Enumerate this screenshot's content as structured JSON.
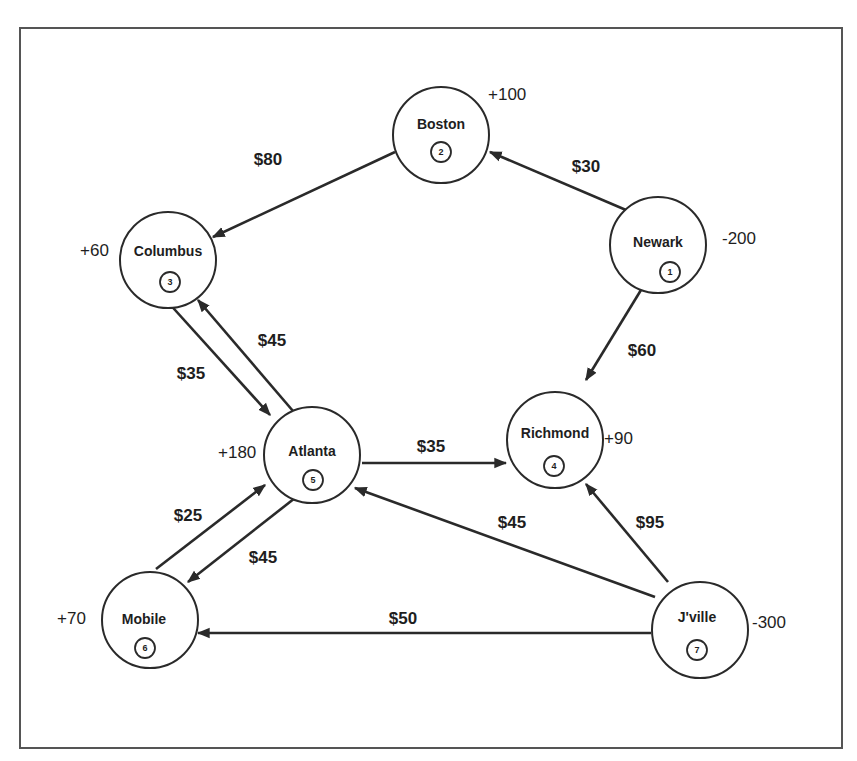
{
  "diagram": {
    "type": "transportation-network",
    "nodes": [
      {
        "id": 1,
        "name": "Newark",
        "number": "1",
        "supply": "-200",
        "cx": 658,
        "cy": 245
      },
      {
        "id": 2,
        "name": "Boston",
        "number": "2",
        "supply": "+100",
        "cx": 441,
        "cy": 135
      },
      {
        "id": 3,
        "name": "Columbus",
        "number": "3",
        "supply": "+60",
        "cx": 168,
        "cy": 260
      },
      {
        "id": 4,
        "name": "Richmond",
        "number": "4",
        "supply": "+90",
        "cx": 555,
        "cy": 440
      },
      {
        "id": 5,
        "name": "Atlanta",
        "number": "5",
        "supply": "+180",
        "cx": 312,
        "cy": 455
      },
      {
        "id": 6,
        "name": "Mobile",
        "number": "6",
        "supply": "+70",
        "cx": 150,
        "cy": 620
      },
      {
        "id": 7,
        "name": "J'ville",
        "number": "7",
        "supply": "-300",
        "cx": 700,
        "cy": 630
      }
    ],
    "edges": [
      {
        "from": "Newark",
        "to": "Boston",
        "cost": "$30"
      },
      {
        "from": "Boston",
        "to": "Columbus",
        "cost": "$80"
      },
      {
        "from": "Newark",
        "to": "Richmond",
        "cost": "$60"
      },
      {
        "from": "Columbus",
        "to": "Atlanta",
        "cost": "$35"
      },
      {
        "from": "Atlanta",
        "to": "Columbus",
        "cost": "$45"
      },
      {
        "from": "Atlanta",
        "to": "Richmond",
        "cost": "$35"
      },
      {
        "from": "Mobile",
        "to": "Atlanta",
        "cost": "$25"
      },
      {
        "from": "Atlanta",
        "to": "Mobile",
        "cost": "$45"
      },
      {
        "from": "J'ville",
        "to": "Atlanta",
        "cost": "$45"
      },
      {
        "from": "J'ville",
        "to": "Richmond",
        "cost": "$95"
      },
      {
        "from": "J'ville",
        "to": "Mobile",
        "cost": "$50"
      }
    ]
  },
  "labels": {
    "newark": {
      "name": "Newark",
      "number": "1",
      "supply": "-200"
    },
    "boston": {
      "name": "Boston",
      "number": "2",
      "supply": "+100"
    },
    "columbus": {
      "name": "Columbus",
      "number": "3",
      "supply": "+60"
    },
    "richmond": {
      "name": "Richmond",
      "number": "4",
      "supply": "+90"
    },
    "atlanta": {
      "name": "Atlanta",
      "number": "5",
      "supply": "+180"
    },
    "mobile": {
      "name": "Mobile",
      "number": "6",
      "supply": "+70"
    },
    "jville": {
      "name": "J'ville",
      "number": "7",
      "supply": "-300"
    },
    "costs": {
      "newark_boston": "$30",
      "boston_columbus": "$80",
      "newark_richmond": "$60",
      "columbus_atlanta": "$35",
      "atlanta_columbus": "$45",
      "atlanta_richmond": "$35",
      "mobile_atlanta": "$25",
      "atlanta_mobile": "$45",
      "jville_atlanta": "$45",
      "jville_richmond": "$95",
      "jville_mobile": "$50"
    }
  }
}
